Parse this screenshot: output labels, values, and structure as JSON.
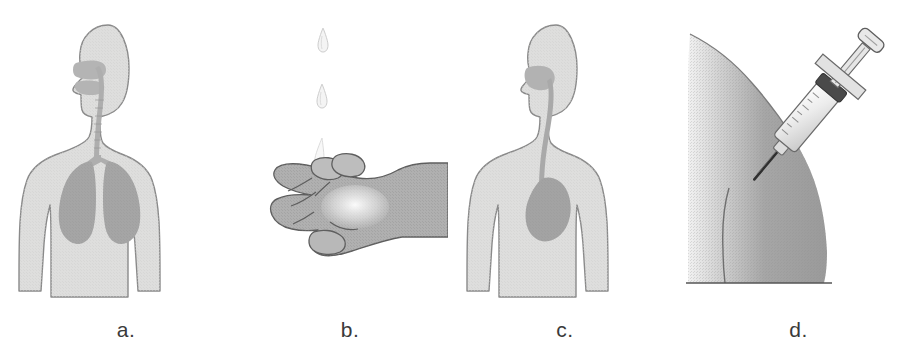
{
  "figure": {
    "width": 915,
    "height": 354,
    "background_color": "#ffffff",
    "label_color": "#3a3a3a"
  },
  "palette": {
    "body_fill": "#dededd",
    "body_outline": "#8a8a8a",
    "organ_fill": "#a9a9a9",
    "organ_fill_light": "#b5b5b5",
    "airway_fill": "#b0b0b0",
    "hand_fill": "#b3b3b3",
    "hand_outline": "#5e5e5e",
    "droplet_fill": "#f2f2f2",
    "droplet_outline": "#c9c9c9",
    "arm_light": "#e8e8e8",
    "arm_dark": "#9a9a9a",
    "syringe_body": "#efefef",
    "syringe_outline": "#6a6a6a",
    "syringe_collar": "#4a4a4a",
    "needle_color": "#2a2a2a",
    "baseline_color": "#555555"
  },
  "panels": [
    {
      "id": "a",
      "label": "a.",
      "subject": "inhalation-route",
      "description": "Front view of a human head and torso silhouette showing the nasal passage, trachea and two lungs shaded darker inside the chest.",
      "organs": [
        "nasal-cavity",
        "oral-cavity",
        "trachea",
        "left-lung",
        "right-lung"
      ]
    },
    {
      "id": "b",
      "label": "b.",
      "subject": "topical-route",
      "description": "A cupped hand, palm up, catching three liquid drops falling from above.",
      "droplet_count": 3
    },
    {
      "id": "c",
      "label": "c.",
      "subject": "oral-route",
      "description": "Front view of a human head and torso silhouette showing the mouth, esophagus and a shaded stomach in the upper abdomen.",
      "organs": [
        "oral-cavity",
        "esophagus",
        "stomach"
      ]
    },
    {
      "id": "d",
      "label": "d.",
      "subject": "injection-route",
      "description": "Side view of a shoulder and upper arm with a syringe angled into the deltoid muscle.",
      "parts": [
        "syringe-plunger",
        "finger-flange",
        "syringe-barrel",
        "needle",
        "upper-arm",
        "shoulder"
      ]
    }
  ]
}
